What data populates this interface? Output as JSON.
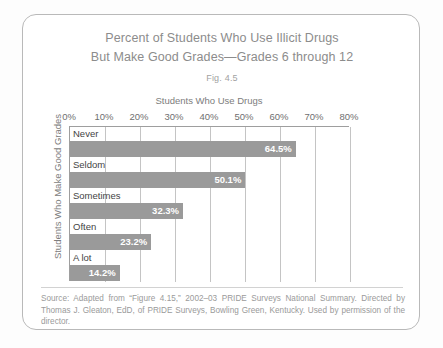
{
  "figure": {
    "title_line_1": "Percent of Students Who Use Illicit Drugs",
    "title_line_2": "But Make Good Grades—Grades 6 through 12",
    "caption": "Fig. 4.5",
    "source_note": "Source: Adapted from “Figure 4.15,” 2002–03 PRIDE Surveys National Summary. Directed by Thomas J. Gleaton, EdD, of PRIDE Surveys, Bowling Green, Kentucky. Used by permission of the director."
  },
  "colors": {
    "bar": "#9a9a9a",
    "gridline": "#c4c4c4",
    "axis": "#9e9e9e",
    "title_text": "#8c8c8c",
    "value_text": "#ffffff"
  },
  "chart_data": {
    "type": "bar",
    "orientation": "horizontal",
    "title": "Percent of Students Who Use Illicit Drugs But Make Good Grades—Grades 6 through 12",
    "subtitle": "Fig. 4.5",
    "xlabel": "Students Who Use Drugs",
    "ylabel": "Students Who Make Good Grades",
    "categories": [
      "Never",
      "Seldom",
      "Sometimes",
      "Often",
      "A lot"
    ],
    "values": [
      64.5,
      50.1,
      32.3,
      23.2,
      14.2
    ],
    "value_labels": [
      "64.5%",
      "50.1%",
      "32.3%",
      "23.2%",
      "14.2%"
    ],
    "xlim": [
      0,
      80
    ],
    "xticks": [
      0,
      10,
      20,
      30,
      40,
      50,
      60,
      70,
      80
    ],
    "xtick_labels": [
      "0%",
      "10%",
      "20%",
      "30%",
      "40%",
      "50%",
      "60%",
      "70%",
      "80%"
    ],
    "grid": "vertical",
    "legend": "none",
    "unit": "percent"
  }
}
